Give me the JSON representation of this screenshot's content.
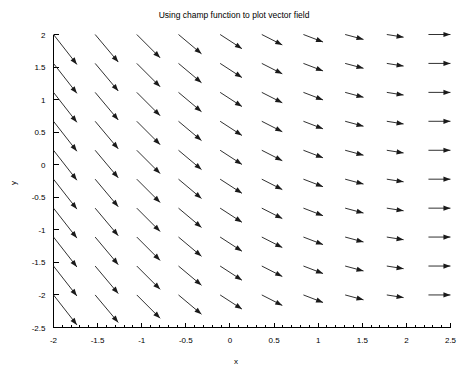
{
  "chart_data": {
    "type": "quiver",
    "title": "Using champ function to plot vector field",
    "xlabel": "x",
    "ylabel": "y",
    "xlim": [
      -2,
      2.5
    ],
    "ylim": [
      -2.5,
      2
    ],
    "xticks": [
      "-2",
      "-1.5",
      "-1",
      "-0.5",
      "0",
      "0.5",
      "1",
      "1.5",
      "2",
      "2.5"
    ],
    "xtick_values": [
      -2,
      -1.5,
      -1,
      -0.5,
      0,
      0.5,
      1,
      1.5,
      2,
      2.5
    ],
    "yticks": [
      "2",
      "1.5",
      "1",
      "0.5",
      "0",
      "-0.5",
      "-1",
      "-1.5",
      "-2",
      "-2.5"
    ],
    "ytick_values": [
      2,
      1.5,
      1,
      0.5,
      0,
      -0.5,
      -1,
      -1.5,
      -2,
      -2.5
    ],
    "x_minor_ticks_per_major": 5,
    "y_minor_ticks_per_major": 1,
    "grid": false,
    "legend": false,
    "grid_x": [
      -2,
      -1.528,
      -1.056,
      -0.583,
      -0.111,
      0.361,
      0.833,
      1.306,
      1.778,
      2.25
    ],
    "grid_y": [
      2,
      1.556,
      1.111,
      0.667,
      0.222,
      -0.222,
      -0.667,
      -1.111,
      -1.556,
      -2
    ],
    "arrow_angles_deg_by_column": [
      -52,
      -50,
      -45,
      -40,
      -33,
      -27,
      -21,
      -15,
      -9,
      0
    ],
    "arrow_lengths_by_column": [
      38,
      36,
      33,
      30,
      26,
      23,
      21,
      19,
      17,
      22
    ],
    "note": "Vector field: arrows rotate from steep down-right on the left to horizontal right at the right edge; magnitude decreases toward the right before the final horizontal column."
  },
  "axis": {
    "xlabel": "x",
    "ylabel": "y"
  }
}
